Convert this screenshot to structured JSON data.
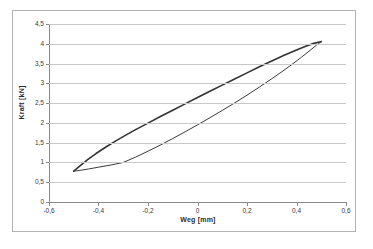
{
  "chart_data": {
    "type": "line",
    "title": "",
    "xlabel": "Weg [mm]",
    "ylabel": "Kraft [kN]",
    "xlim": [
      -0.6,
      0.6
    ],
    "ylim": [
      0,
      4.5
    ],
    "grid": "horizontal",
    "legend": "none",
    "x_ticks": [
      "-0,6",
      "-0,4",
      "-0,2",
      "0",
      "0,2",
      "0,4",
      "0,6"
    ],
    "x_tick_values": [
      -0.6,
      -0.4,
      -0.2,
      0,
      0.2,
      0.4,
      0.6
    ],
    "y_ticks": [
      "0",
      "0,5",
      "1",
      "1,5",
      "2",
      "2,5",
      "3",
      "3,5",
      "4",
      "4,5"
    ],
    "y_tick_values": [
      0,
      0.5,
      1,
      1.5,
      2,
      2.5,
      3,
      3.5,
      4,
      4.5
    ],
    "series": [
      {
        "name": "Hysterese Belastung (oberer Ast)",
        "color": "#333333",
        "width": 1.6,
        "points": [
          [
            -0.5,
            0.78
          ],
          [
            -0.47,
            0.94
          ],
          [
            -0.44,
            1.09
          ],
          [
            -0.41,
            1.225
          ],
          [
            -0.37,
            1.39
          ],
          [
            -0.33,
            1.545
          ],
          [
            -0.29,
            1.69
          ],
          [
            -0.25,
            1.83
          ],
          [
            -0.2,
            1.995
          ],
          [
            -0.15,
            2.16
          ],
          [
            -0.1,
            2.32
          ],
          [
            -0.05,
            2.48
          ],
          [
            0.0,
            2.64
          ],
          [
            0.05,
            2.8
          ],
          [
            0.1,
            2.955
          ],
          [
            0.15,
            3.11
          ],
          [
            0.2,
            3.265
          ],
          [
            0.25,
            3.42
          ],
          [
            0.3,
            3.565
          ],
          [
            0.35,
            3.71
          ],
          [
            0.4,
            3.845
          ],
          [
            0.44,
            3.945
          ],
          [
            0.47,
            4.01
          ],
          [
            0.492,
            4.045
          ],
          [
            0.5,
            4.055
          ]
        ]
      },
      {
        "name": "Hysterese Entlastung (unterer Ast)",
        "color": "#3a3a3a",
        "width": 1.0,
        "points": [
          [
            0.5,
            4.055
          ],
          [
            0.48,
            3.96
          ],
          [
            0.455,
            3.835
          ],
          [
            0.42,
            3.66
          ],
          [
            0.38,
            3.47
          ],
          [
            0.34,
            3.29
          ],
          [
            0.3,
            3.115
          ],
          [
            0.25,
            2.905
          ],
          [
            0.2,
            2.7
          ],
          [
            0.15,
            2.505
          ],
          [
            0.1,
            2.315
          ],
          [
            0.05,
            2.13
          ],
          [
            0.0,
            1.95
          ],
          [
            -0.05,
            1.775
          ],
          [
            -0.1,
            1.605
          ],
          [
            -0.15,
            1.44
          ],
          [
            -0.2,
            1.285
          ],
          [
            -0.25,
            1.135
          ],
          [
            -0.3,
            1.0
          ],
          [
            -0.35,
            0.935
          ],
          [
            -0.4,
            0.88
          ],
          [
            -0.44,
            0.835
          ],
          [
            -0.47,
            0.805
          ],
          [
            -0.49,
            0.787
          ],
          [
            -0.5,
            0.78
          ]
        ]
      }
    ],
    "annotations": []
  }
}
